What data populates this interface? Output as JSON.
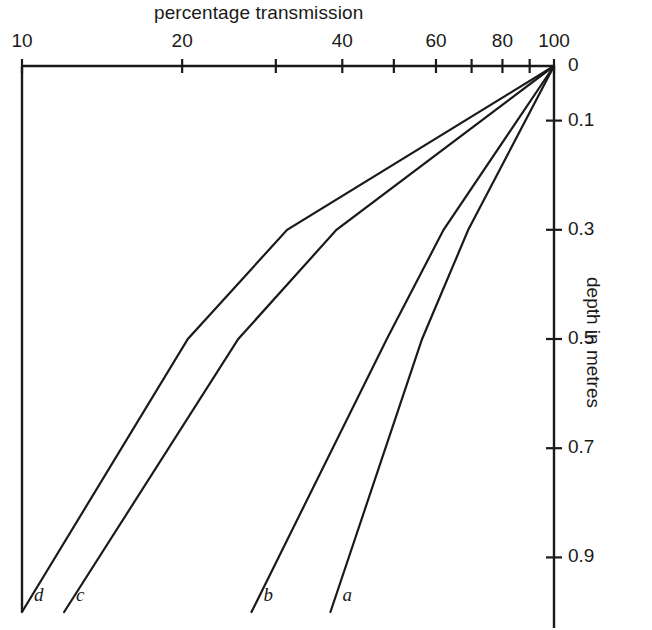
{
  "chart_data": {
    "type": "line",
    "title": "percentage transmission",
    "xlabel": "percentage transmission",
    "ylabel": "depth in metres",
    "xscale": "log",
    "yscale": "linear",
    "xlim": [
      10,
      100
    ],
    "ylim": [
      0,
      1.0
    ],
    "y_inverted": true,
    "x_axis_position": "top",
    "y_axis_position": "right",
    "grid": false,
    "legend": "inline-end-labels",
    "xticks": [
      {
        "value": 10,
        "label": "10"
      },
      {
        "value": 20,
        "label": "20"
      },
      {
        "value": 30,
        "label": ""
      },
      {
        "value": 40,
        "label": "40"
      },
      {
        "value": 50,
        "label": ""
      },
      {
        "value": 60,
        "label": "60"
      },
      {
        "value": 70,
        "label": ""
      },
      {
        "value": 80,
        "label": "80"
      },
      {
        "value": 90,
        "label": ""
      },
      {
        "value": 100,
        "label": "100"
      }
    ],
    "yticks": [
      {
        "value": 0.0,
        "label": "0"
      },
      {
        "value": 0.1,
        "label": "0.1"
      },
      {
        "value": 0.3,
        "label": "0.3"
      },
      {
        "value": 0.5,
        "label": "0.5"
      },
      {
        "value": 0.7,
        "label": "0.7"
      },
      {
        "value": 0.9,
        "label": "0.9"
      }
    ],
    "series": [
      {
        "name": "a",
        "label": "a",
        "points": [
          {
            "transmission": 100,
            "depth": 0.0
          },
          {
            "transmission": 69.0,
            "depth": 0.3
          },
          {
            "transmission": 56.5,
            "depth": 0.5
          },
          {
            "transmission": 38.0,
            "depth": 1.0
          }
        ]
      },
      {
        "name": "b",
        "label": "b",
        "points": [
          {
            "transmission": 100,
            "depth": 0.0
          },
          {
            "transmission": 62.0,
            "depth": 0.3
          },
          {
            "transmission": 48.5,
            "depth": 0.5
          },
          {
            "transmission": 27.0,
            "depth": 1.0
          }
        ]
      },
      {
        "name": "c",
        "label": "c",
        "points": [
          {
            "transmission": 100,
            "depth": 0.0
          },
          {
            "transmission": 39.0,
            "depth": 0.3
          },
          {
            "transmission": 25.5,
            "depth": 0.5
          },
          {
            "transmission": 12.0,
            "depth": 1.0
          }
        ]
      },
      {
        "name": "d",
        "label": "d",
        "points": [
          {
            "transmission": 100,
            "depth": 0.0
          },
          {
            "transmission": 31.5,
            "depth": 0.3
          },
          {
            "transmission": 20.5,
            "depth": 0.5
          },
          {
            "transmission": 10.0,
            "depth": 1.0
          }
        ]
      }
    ],
    "line_color": "#1a1a1a",
    "background_color": "#ffffff"
  },
  "labels": {
    "series_a": "a",
    "series_b": "b",
    "series_c": "c",
    "series_d": "d"
  }
}
